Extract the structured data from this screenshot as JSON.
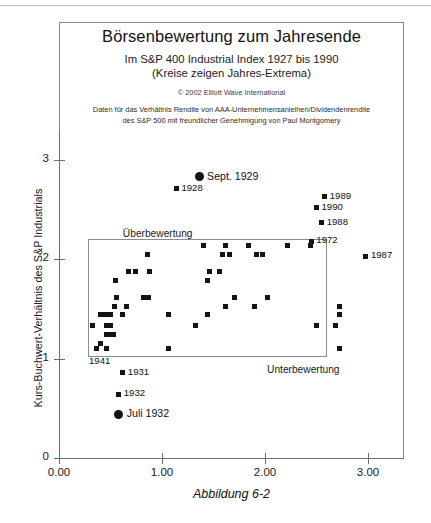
{
  "figure": {
    "title": "Börsenbewertung zum Jahresende",
    "subtitle_1": "Im S&P 400 Industrial Index 1927 bis 1990",
    "subtitle_2": "(Kreise zeigen Jahres-Extrema)",
    "copyright": "© 2002 Elliott Wave  International",
    "credit_line_1": "Daten für das Verhältnis Rendite von AAA-Unternehmensanleihen/Dividendenrendite",
    "credit_line_2": "des S&P 500 mit freundlicher Genehmigung von Paul Montgomery",
    "caption": "Abbildung 6-2"
  },
  "chart_data": {
    "type": "scatter",
    "title": "Börsenbewertung zum Jahresende",
    "subtitle": "Im S&P 400 Industrial Index 1927 bis 1990 (Kreise zeigen Jahres-Extrema)",
    "xlabel": "",
    "ylabel": "Kurs-Buchwert-Verhältnis des S&P Industrials",
    "xlim": [
      0.0,
      3.3
    ],
    "ylim": [
      0.0,
      3.35
    ],
    "xticks": [
      0.0,
      1.0,
      2.0,
      3.0
    ],
    "xticklabels": [
      "0.00",
      "1.00",
      "2.00",
      "3.00"
    ],
    "yticks": [
      0,
      1,
      2,
      3
    ],
    "yticklabels": [
      "0",
      "1",
      "2",
      "3"
    ],
    "grid": false,
    "legend": false,
    "marker": "square",
    "marker_color": "#141414",
    "points": [
      {
        "x": 1.36,
        "y": 2.83,
        "marker": "circle",
        "label": "Sept.    1929"
      },
      {
        "x": 1.14,
        "y": 2.71,
        "marker": "square",
        "label": "1928"
      },
      {
        "x": 2.58,
        "y": 2.63,
        "marker": "square",
        "label": "1989"
      },
      {
        "x": 2.5,
        "y": 2.52,
        "marker": "square",
        "label": "1990"
      },
      {
        "x": 2.55,
        "y": 2.37,
        "marker": "square",
        "label": "1988"
      },
      {
        "x": 2.45,
        "y": 2.18,
        "marker": "square",
        "label": "1972"
      },
      {
        "x": 2.98,
        "y": 2.03,
        "marker": "square",
        "label": "1987"
      },
      {
        "x": 0.4,
        "y": 1.15,
        "marker": "square",
        "label": "1941"
      },
      {
        "x": 0.62,
        "y": 0.86,
        "marker": "square",
        "label": "1931"
      },
      {
        "x": 0.58,
        "y": 0.64,
        "marker": "square",
        "label": "1932"
      },
      {
        "x": 0.58,
        "y": 0.44,
        "marker": "circle",
        "label": "Juli    1932"
      },
      {
        "x": 1.4,
        "y": 2.14,
        "marker": "square",
        "label": ""
      },
      {
        "x": 1.62,
        "y": 2.14,
        "marker": "square",
        "label": ""
      },
      {
        "x": 1.84,
        "y": 2.14,
        "marker": "square",
        "label": ""
      },
      {
        "x": 2.22,
        "y": 2.14,
        "marker": "square",
        "label": ""
      },
      {
        "x": 2.44,
        "y": 2.14,
        "marker": "square",
        "label": ""
      },
      {
        "x": 0.86,
        "y": 2.05,
        "marker": "square",
        "label": ""
      },
      {
        "x": 1.59,
        "y": 2.05,
        "marker": "square",
        "label": ""
      },
      {
        "x": 1.66,
        "y": 2.05,
        "marker": "square",
        "label": ""
      },
      {
        "x": 1.92,
        "y": 2.05,
        "marker": "square",
        "label": ""
      },
      {
        "x": 1.98,
        "y": 2.05,
        "marker": "square",
        "label": ""
      },
      {
        "x": 0.67,
        "y": 1.88,
        "marker": "square",
        "label": ""
      },
      {
        "x": 0.74,
        "y": 1.88,
        "marker": "square",
        "label": ""
      },
      {
        "x": 0.88,
        "y": 1.88,
        "marker": "square",
        "label": ""
      },
      {
        "x": 1.46,
        "y": 1.88,
        "marker": "square",
        "label": ""
      },
      {
        "x": 1.56,
        "y": 1.88,
        "marker": "square",
        "label": ""
      },
      {
        "x": 0.55,
        "y": 1.79,
        "marker": "square",
        "label": ""
      },
      {
        "x": 1.44,
        "y": 1.79,
        "marker": "square",
        "label": ""
      },
      {
        "x": 0.56,
        "y": 1.62,
        "marker": "square",
        "label": ""
      },
      {
        "x": 0.82,
        "y": 1.62,
        "marker": "square",
        "label": ""
      },
      {
        "x": 0.87,
        "y": 1.62,
        "marker": "square",
        "label": ""
      },
      {
        "x": 1.7,
        "y": 1.62,
        "marker": "square",
        "label": ""
      },
      {
        "x": 2.02,
        "y": 1.62,
        "marker": "square",
        "label": ""
      },
      {
        "x": 0.54,
        "y": 1.53,
        "marker": "square",
        "label": ""
      },
      {
        "x": 0.66,
        "y": 1.53,
        "marker": "square",
        "label": ""
      },
      {
        "x": 1.62,
        "y": 1.53,
        "marker": "square",
        "label": ""
      },
      {
        "x": 1.9,
        "y": 1.53,
        "marker": "square",
        "label": ""
      },
      {
        "x": 2.72,
        "y": 1.53,
        "marker": "square",
        "label": ""
      },
      {
        "x": 0.4,
        "y": 1.44,
        "marker": "square",
        "label": ""
      },
      {
        "x": 0.44,
        "y": 1.44,
        "marker": "square",
        "label": ""
      },
      {
        "x": 0.47,
        "y": 1.44,
        "marker": "square",
        "label": ""
      },
      {
        "x": 0.5,
        "y": 1.44,
        "marker": "square",
        "label": ""
      },
      {
        "x": 0.62,
        "y": 1.44,
        "marker": "square",
        "label": ""
      },
      {
        "x": 1.06,
        "y": 1.44,
        "marker": "square",
        "label": ""
      },
      {
        "x": 1.44,
        "y": 1.44,
        "marker": "square",
        "label": ""
      },
      {
        "x": 2.72,
        "y": 1.44,
        "marker": "square",
        "label": ""
      },
      {
        "x": 0.33,
        "y": 1.33,
        "marker": "square",
        "label": ""
      },
      {
        "x": 0.46,
        "y": 1.33,
        "marker": "square",
        "label": ""
      },
      {
        "x": 0.5,
        "y": 1.33,
        "marker": "square",
        "label": ""
      },
      {
        "x": 1.33,
        "y": 1.33,
        "marker": "square",
        "label": ""
      },
      {
        "x": 2.5,
        "y": 1.33,
        "marker": "square",
        "label": ""
      },
      {
        "x": 2.68,
        "y": 1.33,
        "marker": "square",
        "label": ""
      },
      {
        "x": 0.46,
        "y": 1.24,
        "marker": "square",
        "label": ""
      },
      {
        "x": 0.5,
        "y": 1.24,
        "marker": "square",
        "label": ""
      },
      {
        "x": 0.53,
        "y": 1.24,
        "marker": "square",
        "label": ""
      },
      {
        "x": 0.36,
        "y": 1.1,
        "marker": "square",
        "label": ""
      },
      {
        "x": 0.46,
        "y": 1.1,
        "marker": "square",
        "label": ""
      },
      {
        "x": 1.06,
        "y": 1.1,
        "marker": "square",
        "label": ""
      },
      {
        "x": 2.72,
        "y": 1.1,
        "marker": "square",
        "label": ""
      }
    ],
    "annotations": [
      {
        "text": "Überbewertung",
        "x": 0.62,
        "y": 2.25
      },
      {
        "text": "Unterbewertung",
        "x": 2.02,
        "y": 0.88
      }
    ],
    "reference_box": {
      "x0": 0.28,
      "x1": 2.6,
      "y0": 1.02,
      "y1": 2.2
    }
  },
  "axis": {
    "y_title": "Kurs-Buchwert-Verhältnis des S&P Industrials",
    "y_ticks": [
      "3",
      "2",
      "1",
      "0"
    ],
    "x_ticks": [
      "0.00",
      "1.00",
      "2.00",
      "3.00"
    ]
  },
  "zones": {
    "over": "Überbewertung",
    "under": "Unterbewertung"
  }
}
